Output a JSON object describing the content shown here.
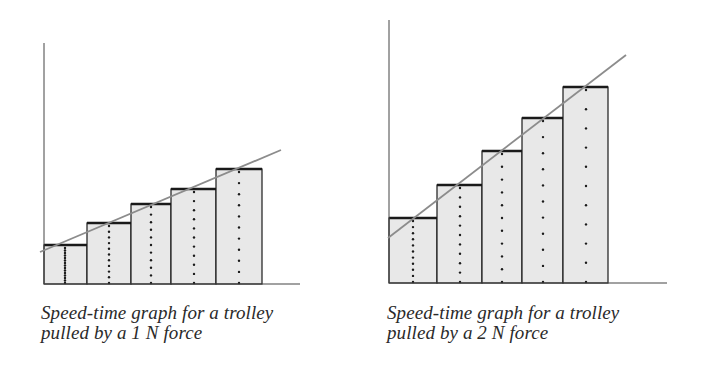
{
  "colors": {
    "bar_fill": "#e8e8e8",
    "bar_outline": "#1a1a1a",
    "axis": "#444444",
    "trend_line": "#8c8c8c",
    "dots": "#1a1a1a",
    "caption_text": "#2a2a2a"
  },
  "figures": [
    {
      "caption_line1": "Speed-time graph for a trolley",
      "caption_line2": "pulled by a 1 N force"
    },
    {
      "caption_line1": "Speed-time graph for a trolley",
      "caption_line2": "pulled by a 2 N force"
    }
  ],
  "chart_data": [
    {
      "type": "bar",
      "title": "Speed-time graph for a trolley pulled by a 1 N force",
      "xlabel": "time",
      "ylabel": "speed",
      "categories": [
        "interval 1",
        "interval 2",
        "interval 3",
        "interval 4",
        "interval 5"
      ],
      "values": [
        39,
        61,
        80,
        95,
        115
      ],
      "bar_widths": [
        43,
        44,
        40,
        45,
        46
      ],
      "trend_line": {
        "from": [
          0,
          32
        ],
        "to": [
          237,
          134
        ]
      },
      "dotted_center_lines": true,
      "grid": false,
      "layout": {
        "axis_origin": [
          44,
          284
        ],
        "axis_top": 43,
        "baseline_end": 300,
        "bar_edges_x": [
          44,
          87,
          131,
          171,
          216,
          262
        ],
        "bar_tops_y": [
          245,
          223,
          204,
          189,
          169
        ],
        "line_px": [
          [
            40,
            252
          ],
          [
            281,
            150
          ]
        ]
      }
    },
    {
      "type": "bar",
      "title": "Speed-time graph for a trolley pulled by a 2 N force",
      "xlabel": "time",
      "ylabel": "speed",
      "categories": [
        "interval 1",
        "interval 2",
        "interval 3",
        "interval 4",
        "interval 5"
      ],
      "values": [
        65,
        98,
        132,
        165,
        196
      ],
      "bar_widths": [
        48,
        45,
        40,
        41,
        45
      ],
      "trend_line": {
        "from": [
          0,
          45
        ],
        "to": [
          237,
          228
        ]
      },
      "dotted_center_lines": true,
      "grid": false,
      "layout": {
        "axis_origin": [
          389,
          283
        ],
        "axis_top": 20,
        "baseline_end": 667,
        "bar_edges_x": [
          389,
          437,
          482,
          522,
          563,
          608
        ],
        "bar_tops_y": [
          218,
          185,
          151,
          118,
          87
        ],
        "line_px": [
          [
            388,
            238
          ],
          [
            626,
            55
          ]
        ]
      }
    }
  ]
}
